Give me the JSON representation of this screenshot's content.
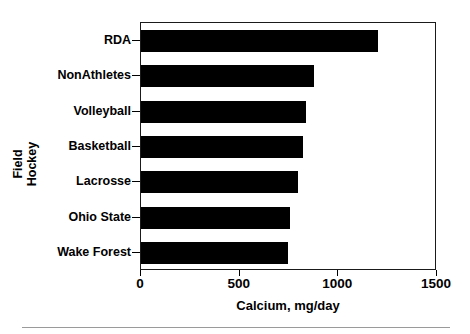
{
  "chart_data": {
    "type": "bar",
    "orientation": "horizontal",
    "title": "",
    "xlabel": "Calcium,  mg/day",
    "ylabel": "Field Hockey",
    "ylabel_lines": [
      "Field",
      "Hockey"
    ],
    "categories": [
      "RDA",
      "NonAthletes",
      "Volleyball",
      "Basketball",
      "Lacrosse",
      "Ohio State",
      "Wake Forest"
    ],
    "values": [
      1200,
      875,
      835,
      820,
      795,
      755,
      745
    ],
    "xlim": [
      0,
      1500
    ],
    "xticks": [
      0,
      500,
      1000,
      1500
    ],
    "xtick_labels": [
      "0",
      "500",
      "1000",
      "1500"
    ],
    "grid": false,
    "legend": "none",
    "bar_color": "#000000",
    "frame_color": "#1a1a1a",
    "background": "#ffffff"
  },
  "figure": {
    "x_axis_label": "Calcium,  mg/day",
    "y_axis_label_line1": "Field",
    "y_axis_label_line2": "Hockey",
    "tick_labels": {
      "t0": "0",
      "t1": "500",
      "t2": "1000",
      "t3": "1500"
    },
    "bars": [
      {
        "label": "RDA",
        "value": 1200
      },
      {
        "label": "NonAthletes",
        "value": 875
      },
      {
        "label": "Volleyball",
        "value": 835
      },
      {
        "label": "Basketball",
        "value": 820
      },
      {
        "label": "Lacrosse",
        "value": 795
      },
      {
        "label": "Ohio State",
        "value": 755
      },
      {
        "label": "Wake Forest",
        "value": 745
      }
    ]
  }
}
